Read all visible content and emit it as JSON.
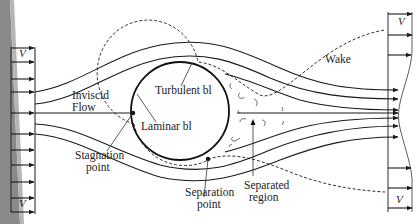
{
  "figure": {
    "labels": {
      "inviscid_flow_1": "Inviscid",
      "inviscid_flow_2": "Flow",
      "turbulent_bl": "Turbulent bl",
      "laminar_bl": "Laminar bl",
      "stagnation_1": "Stagnation",
      "stagnation_2": "point",
      "separation_1": "Separation",
      "separation_2": "point",
      "separated_1": "Separated",
      "separated_2": "region",
      "wake": "Wake"
    },
    "velocity_symbol_inlet_top": "V",
    "velocity_symbol_inlet_bottom": "V",
    "velocity_symbol_outlet_top": "V",
    "velocity_symbol_outlet_bottom": "V"
  },
  "colors": {
    "background": "#ffffff",
    "ink": "#1a1a1a",
    "left_shadow": "#8a8a8a"
  }
}
